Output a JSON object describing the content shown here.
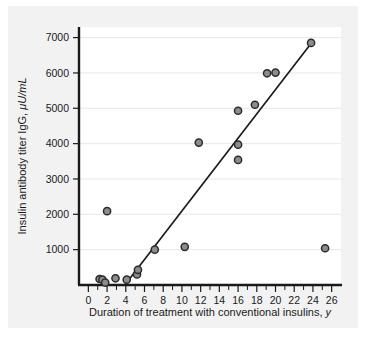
{
  "figure": {
    "background_color": "#f2f2f2",
    "plot_background_color": "#ffffff",
    "axis_color": "#1a1a1a",
    "grid_color": "#e8e8e8",
    "marker_fill": "#8c8c8c",
    "marker_edge": "#2b2b2b",
    "line_color": "#1a1a1a"
  },
  "chart_data": {
    "type": "scatter",
    "title": "",
    "xlabel": "Duration of treatment with conventional insulins, y",
    "xlabel_plain": "Duration of treatment with conventional insulins,",
    "xlabel_italic": "y",
    "ylabel": "Insulin antibody titer IgG, μU/mL",
    "ylabel_plain": "Insulin antibody titer IgG,",
    "ylabel_italic": "μU/mL",
    "xlim": [
      -1,
      27
    ],
    "ylim": [
      0,
      7300
    ],
    "xticks": [
      0,
      2,
      4,
      6,
      8,
      10,
      12,
      14,
      16,
      18,
      20,
      22,
      24,
      26
    ],
    "xtick_labels": [
      "0",
      "2",
      "4",
      "6",
      "8",
      "10",
      "12",
      "14",
      "16",
      "18",
      "20",
      "22",
      "24",
      "26"
    ],
    "xtick_minor": [
      1,
      3,
      5,
      7,
      9,
      11,
      13,
      15,
      17,
      19,
      21,
      23,
      25
    ],
    "yticks": [
      1000,
      2000,
      3000,
      4000,
      5000,
      6000,
      7000
    ],
    "ytick_labels": [
      "1000",
      "2000",
      "3000",
      "4000",
      "5000",
      "6000",
      "7000"
    ],
    "grid": true,
    "grid_axis": "y",
    "legend": "none",
    "points": [
      {
        "x": 1.2,
        "y": 170
      },
      {
        "x": 1.5,
        "y": 150
      },
      {
        "x": 1.8,
        "y": 70
      },
      {
        "x": 2.0,
        "y": 2090
      },
      {
        "x": 2.9,
        "y": 190
      },
      {
        "x": 4.1,
        "y": 150
      },
      {
        "x": 5.2,
        "y": 300
      },
      {
        "x": 5.3,
        "y": 430
      },
      {
        "x": 7.1,
        "y": 1000
      },
      {
        "x": 10.3,
        "y": 1080
      },
      {
        "x": 11.8,
        "y": 4030
      },
      {
        "x": 16.0,
        "y": 3540
      },
      {
        "x": 16.0,
        "y": 3970
      },
      {
        "x": 16.0,
        "y": 4930
      },
      {
        "x": 17.8,
        "y": 5100
      },
      {
        "x": 19.1,
        "y": 5990
      },
      {
        "x": 20.0,
        "y": 6010
      },
      {
        "x": 23.8,
        "y": 6850
      },
      {
        "x": 25.3,
        "y": 1040
      }
    ],
    "fit_line": {
      "type": "linear-regression",
      "x_start": 3.9,
      "y_start": 0,
      "x_end": 23.9,
      "y_end": 6870
    }
  }
}
